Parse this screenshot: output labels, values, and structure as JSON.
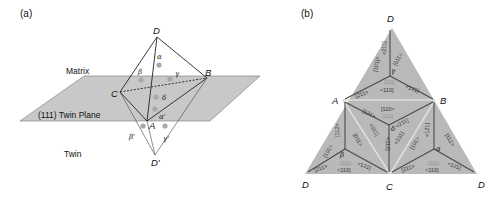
{
  "panel_a": {
    "label": "(a)",
    "matrix_label": "Matrix",
    "plane_label": "(111) Twin Plane",
    "twin_label": "Twin",
    "vertices": {
      "D": "D",
      "B": "B",
      "C": "C",
      "A": "A",
      "D_prime": "D'"
    },
    "greek": {
      "alpha": "α",
      "beta": "β",
      "gamma": "γ",
      "delta": "δ",
      "alpha_p": "α'",
      "beta_p": "β'",
      "gamma_p": "γ'"
    },
    "colors": {
      "plane": "#c8c8c8",
      "dot": "#a8a8a8",
      "line": "#222222"
    }
  },
  "panel_b": {
    "label": "(b)",
    "vertices": {
      "D_top": "D",
      "A": "A",
      "B": "B",
      "D_left": "D",
      "C": "C",
      "D_right": "D"
    },
    "faces": {
      "gamma": {
        "name": "γ",
        "left": "[101]>",
        "vert": "<211]",
        "right": "[011>",
        "plane": "(111)",
        "bl": "[211>",
        "bm": "<110]",
        "br": "<121]"
      },
      "delta": {
        "name": "δ",
        "top": "[110>",
        "plane": "(111)",
        "l1": "[121>",
        "l2": "<011]",
        "vert": "<112]",
        "r1": "<211]",
        "r2": "<101]"
      },
      "beta": {
        "name": "β",
        "outer": "[101>",
        "vert": "[112>",
        "inner": "[011>",
        "plane": "(111)",
        "bl": "[211>",
        "bm": "<110]",
        "br": "<121]"
      },
      "alpha": {
        "name": "α",
        "inner": "[101>",
        "vert": "<121]",
        "outer": "[112>",
        "plane": "(111)",
        "bl": "[211>",
        "bm": "<110]",
        "br": "<121]"
      }
    },
    "colors": {
      "fill": "#b9b9b9",
      "edge": "#d8d8d8",
      "line": "#4a4a4a",
      "plane_text": "#8c8c8c"
    }
  }
}
